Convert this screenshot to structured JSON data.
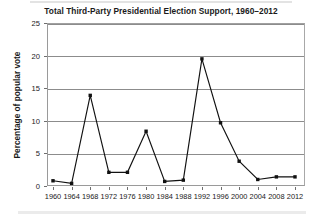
{
  "chart_data": {
    "type": "line",
    "title": "Total Third-Party Presidential Election Support, 1960–2012",
    "xlabel": "",
    "ylabel": "Percentage of popular vote",
    "categories": [
      "1960",
      "1964",
      "1968",
      "1972",
      "1976",
      "1980",
      "1984",
      "1988",
      "1992",
      "1996",
      "2000",
      "2004",
      "2008",
      "2012"
    ],
    "values": [
      0.8,
      0.4,
      13.9,
      2.1,
      2.1,
      8.4,
      0.7,
      0.9,
      19.5,
      9.7,
      3.8,
      1.0,
      1.4,
      1.4
    ],
    "x": [
      1960,
      1964,
      1968,
      1972,
      1976,
      1980,
      1984,
      1988,
      1992,
      1996,
      2000,
      2004,
      2008,
      2012
    ],
    "ylim": [
      0,
      25
    ],
    "xlim": [
      1958,
      2014
    ],
    "yticks": [
      0,
      5,
      10,
      15,
      20,
      25
    ],
    "ytick_labels": [
      "0",
      "5",
      "10",
      "15",
      "20",
      "25"
    ],
    "xtick_labels": [
      "1960",
      "1964",
      "1968",
      "1972",
      "1976",
      "1980",
      "1984",
      "1988",
      "1992",
      "1996",
      "2000",
      "2004",
      "2008",
      "2012"
    ],
    "grid": "horizontal",
    "legend": "none",
    "series": [
      {
        "name": "Third-party share of popular vote",
        "values": [
          0.8,
          0.4,
          13.9,
          2.1,
          2.1,
          8.4,
          0.7,
          0.9,
          19.5,
          9.7,
          3.8,
          1.0,
          1.4,
          1.4
        ]
      }
    ],
    "marker": "square",
    "line_color": "#111111",
    "grid_color": "#8c8c8c",
    "frame_color": "#9a9a9a",
    "background_color": "#ffffff"
  }
}
